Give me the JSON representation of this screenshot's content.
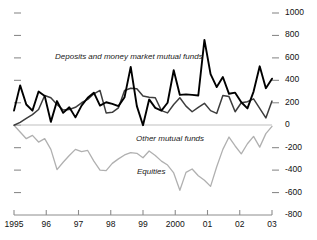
{
  "chart_data": {
    "type": "line",
    "title": "",
    "subtitle": "",
    "xlabel": "",
    "ylabel": "",
    "ylim": [
      -800,
      1000
    ],
    "ytick_values": [
      1000,
      800,
      600,
      400,
      200,
      0,
      -200,
      -400,
      -600,
      -800
    ],
    "ytick_labels": [
      "1000",
      "800",
      "600",
      "400",
      "200",
      "0",
      "-200",
      "-400",
      "-600",
      "-800"
    ],
    "yaxis_position": "right",
    "left_axis_ticks_unlabeled": true,
    "grid": false,
    "zero_line": true,
    "xtick_labels": [
      "1995",
      "96",
      "97",
      "98",
      "99",
      "2000",
      "01",
      "02",
      "03"
    ],
    "x_start": 1995.0,
    "x_end": 2003.0,
    "x_step": 0.25,
    "legend_position": "inline-annotations",
    "series": [
      {
        "name": "Deposits and money market mutual funds",
        "color": "#000000",
        "width": 1.9,
        "values": [
          130,
          355,
          185,
          130,
          300,
          260,
          30,
          215,
          110,
          160,
          70,
          175,
          245,
          290,
          175,
          205,
          190,
          170,
          250,
          520,
          170,
          0,
          230,
          155,
          130,
          200,
          490,
          270,
          275,
          270,
          265,
          760,
          455,
          340,
          430,
          280,
          290,
          205,
          150,
          300,
          525,
          330,
          415
        ]
      },
      {
        "name": "Other mutual funds",
        "color": "#3d3d3d",
        "width": 1.5,
        "values": [
          0,
          25,
          60,
          95,
          140,
          265,
          245,
          185,
          135,
          140,
          160,
          200,
          230,
          280,
          310,
          110,
          115,
          155,
          310,
          330,
          325,
          260,
          250,
          245,
          130,
          110,
          185,
          245,
          170,
          120,
          160,
          195,
          130,
          105,
          265,
          255,
          120,
          200,
          210,
          235,
          150,
          65,
          215
        ]
      },
      {
        "name": "Equities",
        "color": "#b0b0b0",
        "width": 1.3,
        "values": [
          0,
          -60,
          -120,
          -90,
          -150,
          -120,
          -215,
          -395,
          -330,
          -270,
          -215,
          -235,
          -225,
          -320,
          -400,
          -405,
          -340,
          -300,
          -265,
          -245,
          -250,
          -290,
          -230,
          -270,
          -320,
          -355,
          -425,
          -580,
          -420,
          -390,
          -450,
          -490,
          -545,
          -370,
          -215,
          -105,
          -185,
          -255,
          -165,
          -100,
          -195,
          -75,
          -10
        ]
      }
    ],
    "annotations": [
      {
        "text": "Deposits and money market mutual funds",
        "series": "Deposits and money market mutual funds",
        "x_px": 55,
        "y_px": 52
      },
      {
        "text": "Other mutual funds",
        "series": "Other mutual funds",
        "x_px": 136,
        "y_px": 134
      },
      {
        "text": "Equities",
        "series": "Equities",
        "x_px": 137,
        "y_px": 167
      }
    ]
  },
  "axis": {
    "y_right": [
      "1000",
      "800",
      "600",
      "400",
      "200",
      "0",
      "-200",
      "-400",
      "-600",
      "-800"
    ],
    "x_bottom": [
      "1995",
      "96",
      "97",
      "98",
      "99",
      "2000",
      "01",
      "02",
      "03"
    ]
  },
  "colors": {
    "deposits": "#000000",
    "other_funds": "#3d3d3d",
    "equities": "#b0b0b0",
    "axis": "#8c8c8c",
    "zero_line": "#c0c0c0",
    "text": "#111111"
  }
}
